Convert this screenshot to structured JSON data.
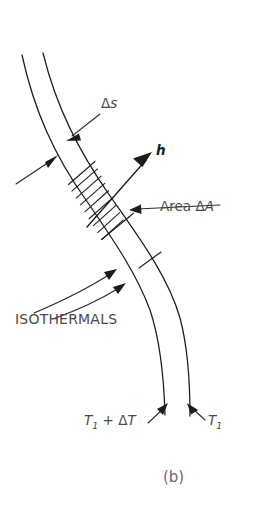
{
  "figure": {
    "caption": "(b)",
    "kind": "heat-flow-tube-diagram",
    "background_color": "#ffffff",
    "line_color": "#1c1c1c",
    "text_color": "#4a4a4a"
  },
  "labels": {
    "arc_length": {
      "delta": "Δ",
      "symbol": "s",
      "full": "Δs"
    },
    "flux_vector": {
      "symbol": "h",
      "full": "h"
    },
    "area": {
      "word": "Area",
      "delta": "Δ",
      "symbol": "A",
      "full": "Area ΔA"
    },
    "isothermals": {
      "full": "ISOTHERMALS"
    },
    "temperature_hot": {
      "base": "T",
      "subscript": "1",
      "operator": "+",
      "delta": "Δ",
      "delta_symbol": "T",
      "full": "T₁ + ΔT"
    },
    "temperature_cold": {
      "base": "T",
      "subscript": "1",
      "full": "T₁"
    }
  },
  "geometry": {
    "tube_left_wall": "M 22,55 C 34,110 54,155 86,200 C 112,238 136,272 150,310 C 160,340 164,380 165,415",
    "tube_right_wall": "M 43,53 C 56,106 78,150 110,196 C 138,236 168,276 180,318 C 188,348 190,382 190,416",
    "hatch_band_upper_boundary": "M 70,183 L 93,163",
    "hatch_band_lower_boundary": "M 103,238 L 127,219",
    "isothermal_leader_a": "M 36,312 C 62,300 86,290 113,272",
    "isothermal_leader_b": "M 54,318 C 76,310 100,300 122,286",
    "delta_s_leader": "M 101,113 L 70,137",
    "area_leader": "M 222,203 L 132,208",
    "left_wall_leader": "M 18,183 L 55,158",
    "flux_vector_shaft": "M 88,226 L 152,155"
  },
  "hatch": {
    "count": 8,
    "spacing_px": 7.6
  }
}
